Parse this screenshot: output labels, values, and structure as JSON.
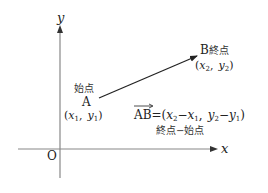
{
  "diagram": {
    "type": "coordinate-vector",
    "axes": {
      "x_label": "x",
      "y_label": "y",
      "origin_label": "O"
    },
    "point_a": {
      "name": "A",
      "role_label": "始点",
      "coord_open": "(",
      "coord_x": "x",
      "coord_x_sub": "1",
      "coord_sep": ",",
      "coord_y": "y",
      "coord_y_sub": "1",
      "coord_close": ")"
    },
    "point_b": {
      "name": "B",
      "role_label": "終点",
      "coord_open": "(",
      "coord_x": "x",
      "coord_x_sub": "2",
      "coord_sep": ",",
      "coord_y": "y",
      "coord_y_sub": "2",
      "coord_close": ")"
    },
    "formula": {
      "vector": "AB",
      "equals": "=(",
      "x2": "x",
      "x2_sub": "2",
      "minus1": "−",
      "x1": "x",
      "x1_sub": "1",
      "sep": ",",
      "y2": "y",
      "y2_sub": "2",
      "minus2": "−",
      "y1": "y",
      "y1_sub": "1",
      "close": ")",
      "caption": "終点−始点"
    },
    "colors": {
      "axis": "#888888",
      "vector": "#222222",
      "text": "#222222"
    }
  }
}
